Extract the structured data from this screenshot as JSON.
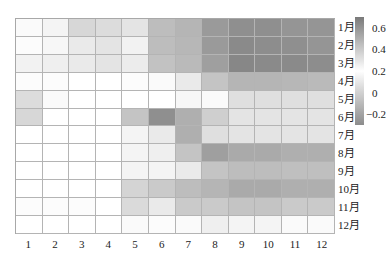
{
  "chart_data": {
    "type": "heatmap",
    "title": "",
    "xlabel": "",
    "ylabel": "",
    "x_categories": [
      "1",
      "2",
      "3",
      "4",
      "5",
      "6",
      "7",
      "8",
      "9",
      "10",
      "11",
      "12"
    ],
    "y_categories": [
      "1月",
      "2月",
      "3月",
      "4月",
      "5月",
      "6月",
      "7月",
      "8月",
      "9月",
      "10月",
      "11月",
      "12月"
    ],
    "values": [
      [
        0.22,
        0.24,
        0.35,
        0.33,
        0.3,
        0.45,
        0.48,
        0.58,
        0.62,
        0.62,
        0.6,
        0.6
      ],
      [
        0.21,
        0.23,
        0.28,
        0.3,
        0.25,
        0.45,
        0.47,
        0.58,
        0.64,
        0.63,
        0.62,
        0.6
      ],
      [
        0.25,
        0.26,
        0.28,
        0.3,
        0.27,
        0.43,
        0.46,
        0.56,
        0.65,
        0.64,
        0.64,
        0.63
      ],
      [
        0.21,
        0.21,
        0.2,
        0.2,
        0.21,
        0.22,
        0.28,
        0.42,
        0.48,
        0.48,
        0.47,
        0.46
      ],
      [
        0.33,
        0.22,
        0.2,
        0.2,
        0.2,
        0.2,
        0.23,
        0.22,
        0.32,
        0.32,
        0.32,
        0.32
      ],
      [
        0.35,
        0.2,
        0.2,
        0.2,
        0.42,
        0.62,
        0.5,
        0.38,
        0.3,
        0.3,
        0.3,
        0.3
      ],
      [
        0.2,
        0.2,
        0.2,
        0.2,
        0.24,
        0.28,
        0.5,
        0.32,
        0.3,
        0.3,
        0.3,
        0.3
      ],
      [
        0.2,
        0.2,
        0.2,
        0.2,
        0.24,
        0.26,
        0.42,
        0.56,
        0.52,
        0.52,
        0.5,
        0.5
      ],
      [
        0.2,
        0.2,
        0.2,
        0.2,
        0.24,
        0.24,
        0.28,
        0.42,
        0.45,
        0.45,
        0.44,
        0.44
      ],
      [
        0.2,
        0.2,
        0.2,
        0.2,
        0.36,
        0.4,
        0.45,
        0.48,
        0.52,
        0.52,
        0.5,
        0.5
      ],
      [
        0.21,
        0.21,
        0.21,
        0.2,
        0.34,
        0.28,
        0.4,
        0.4,
        0.42,
        0.42,
        0.4,
        0.4
      ],
      [
        0.2,
        0.2,
        0.2,
        0.2,
        0.22,
        0.21,
        0.22,
        0.26,
        0.24,
        0.24,
        0.22,
        0.22
      ]
    ],
    "colorbar": {
      "ticks": [
        "0.6",
        "0.4",
        "0.2",
        "0",
        "−0.2"
      ],
      "tick_values": [
        0.6,
        0.4,
        0.2,
        0,
        -0.2
      ],
      "vmin": -0.3,
      "vmax": 0.7,
      "center": 0.2,
      "colors": {
        "high": "#7a7a7a",
        "center": "#ffffff",
        "low": "#8c8c8c"
      }
    },
    "grid": true,
    "legend_position": "right"
  }
}
